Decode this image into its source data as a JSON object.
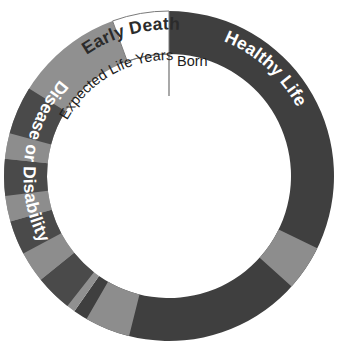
{
  "chart_data": {
    "type": "pie",
    "title": "",
    "subtitle": "",
    "variant": "donut",
    "center": [
      169,
      176
    ],
    "outer_radius": 165,
    "inner_radius": 122,
    "start_angle_deg": -90,
    "direction": "clockwise",
    "grid": false,
    "legend": "none",
    "xlabel": "",
    "ylabel": "",
    "annotations": [
      {
        "name": "born-marker",
        "text": "Born",
        "angle_deg": -90,
        "placement": "inside-right-of-12-oclock"
      },
      {
        "name": "expected-life-years",
        "text": "Expected Life Years",
        "angle_deg": -125,
        "placement": "inside-arc-upper-left"
      }
    ],
    "sections": [
      {
        "label": "Healthy Life",
        "start_deg": -90,
        "end_deg": 125,
        "sweep_deg": 215,
        "color": "#3f3f3f",
        "text_color": "#ffffff"
      },
      {
        "label": "Disease or Disability",
        "start_deg": 125,
        "end_deg": 250,
        "sweep_deg": 125,
        "color": "#909090",
        "text_color": "#ffffff"
      },
      {
        "label": "Early Death",
        "start_deg": 250,
        "end_deg": 270,
        "sweep_deg": 20,
        "color": "#ffffff",
        "text_color": "#2b2b2b"
      }
    ],
    "categories": [
      "Healthy Life",
      "Disease or Disability",
      "Early Death"
    ],
    "values": [
      215,
      125,
      20
    ],
    "value_unit": "degrees of arc",
    "bands": [
      {
        "start_deg": 26,
        "end_deg": 42,
        "color": "#8d8d8d"
      },
      {
        "start_deg": 104,
        "end_deg": 120,
        "color": "#8d8d8d"
      },
      {
        "start_deg": 128,
        "end_deg": 141,
        "color": "#4a4a4a"
      },
      {
        "start_deg": 141,
        "end_deg": 152,
        "color": "#8d8d8d"
      },
      {
        "start_deg": 152,
        "end_deg": 164,
        "color": "#4a4a4a"
      },
      {
        "start_deg": 164,
        "end_deg": 173,
        "color": "#8d8d8d"
      },
      {
        "start_deg": 173,
        "end_deg": 186,
        "color": "#4a4a4a"
      },
      {
        "start_deg": 186,
        "end_deg": 195,
        "color": "#8d8d8d"
      },
      {
        "start_deg": 195,
        "end_deg": 212,
        "color": "#4a4a4a"
      }
    ],
    "colors": {
      "healthy_life": "#3f3f3f",
      "disease_or_disability": "#909090",
      "early_death": "#ffffff",
      "band_light": "#8d8d8d",
      "band_dark": "#4a4a4a",
      "outline": "#7a7a7a",
      "background": "#ffffff"
    }
  }
}
